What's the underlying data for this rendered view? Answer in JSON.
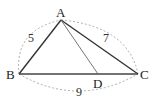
{
  "diagram": {
    "type": "triangle",
    "vertices": {
      "A": {
        "label": "A",
        "x": 61,
        "y": 20
      },
      "B": {
        "label": "B",
        "x": 19,
        "y": 74
      },
      "C": {
        "label": "C",
        "x": 138,
        "y": 74
      },
      "D": {
        "label": "D",
        "x": 98,
        "y": 74
      }
    },
    "sides": [
      {
        "from": "A",
        "to": "B",
        "length_label": "5"
      },
      {
        "from": "A",
        "to": "C",
        "length_label": "7"
      },
      {
        "from": "B",
        "to": "C",
        "length_label": "9"
      }
    ],
    "segments": [
      {
        "from": "A",
        "to": "D",
        "style": "thin"
      }
    ],
    "colors": {
      "line": "#333333",
      "dashed": "#999999",
      "text": "#222222"
    }
  }
}
